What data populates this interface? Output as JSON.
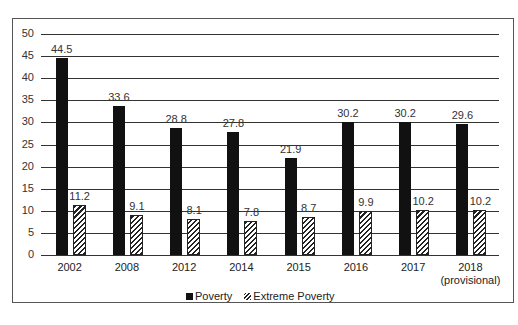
{
  "chart_data": {
    "type": "bar",
    "title": "",
    "xlabel": "",
    "ylabel": "",
    "ylim": [
      0,
      50
    ],
    "yticks": [
      0,
      5,
      10,
      15,
      20,
      25,
      30,
      35,
      40,
      45,
      50
    ],
    "grid": true,
    "legend_position": "bottom",
    "categories": [
      "2002",
      "2008",
      "2012",
      "2014",
      "2015",
      "2016",
      "2017",
      "2018 (provisional)"
    ],
    "series": [
      {
        "name": "Poverty",
        "color": "#111111",
        "pattern": "solid",
        "values": [
          44.5,
          33.6,
          28.8,
          27.8,
          21.9,
          30.2,
          30.2,
          29.6
        ]
      },
      {
        "name": "Extreme Poverty",
        "color": "#222222",
        "pattern": "diagonal-hatch",
        "values": [
          11.2,
          9.1,
          8.1,
          7.8,
          8.7,
          9.9,
          10.2,
          10.2
        ]
      }
    ]
  },
  "axis": {
    "y_labels": [
      "0",
      "5",
      "10",
      "15",
      "20",
      "25",
      "30",
      "35",
      "40",
      "45",
      "50"
    ]
  },
  "x_labels": [
    {
      "line1": "2002",
      "line2": ""
    },
    {
      "line1": "2008",
      "line2": ""
    },
    {
      "line1": "2012",
      "line2": ""
    },
    {
      "line1": "2014",
      "line2": ""
    },
    {
      "line1": "2015",
      "line2": ""
    },
    {
      "line1": "2016",
      "line2": ""
    },
    {
      "line1": "2017",
      "line2": ""
    },
    {
      "line1": "2018",
      "line2": "(provisional)"
    }
  ],
  "value_labels": {
    "poverty": [
      "44.5",
      "33.6",
      "28.8",
      "27.8",
      "21.9",
      "30.2",
      "30.2",
      "29.6"
    ],
    "extreme": [
      "11.2",
      "9.1",
      "8.1",
      "7.8",
      "8.7",
      "9.9",
      "10.2",
      "10.2"
    ]
  },
  "legend": {
    "poverty": "Poverty",
    "extreme": "Extreme Poverty"
  }
}
